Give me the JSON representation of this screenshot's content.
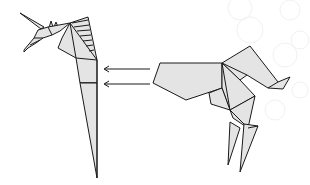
{
  "diagram": {
    "type": "origami-instruction-step",
    "left_model": "unicorn-head-and-neck",
    "right_model": "unicorn-body-and-legs",
    "arrows": [
      {
        "direction": "left",
        "from": [
          150,
          69
        ],
        "to": [
          104,
          69
        ]
      },
      {
        "direction": "left",
        "from": [
          150,
          84
        ],
        "to": [
          104,
          84
        ]
      }
    ],
    "colors": {
      "paper": "#e4e4e4",
      "outline": "#1a1a1a",
      "background": "#ffffff",
      "watermark": "#f1f1f1"
    }
  }
}
